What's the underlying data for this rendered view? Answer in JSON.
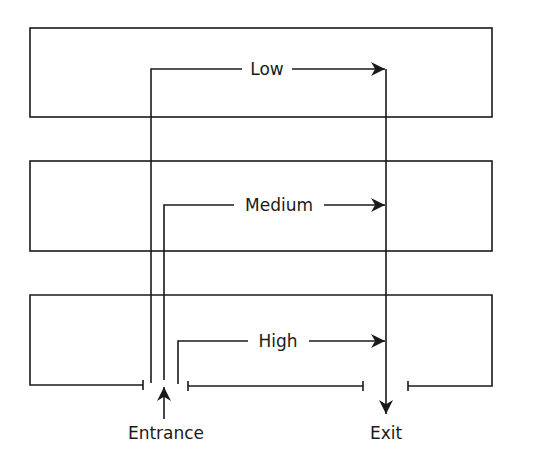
{
  "diagram": {
    "type": "flow-path",
    "colors": {
      "line": "#1a1a1a",
      "background": "#ffffff"
    },
    "zones": [
      {
        "id": "top",
        "path_label": "Low"
      },
      {
        "id": "middle",
        "path_label": "Medium"
      },
      {
        "id": "bottom",
        "path_label": "High"
      }
    ],
    "entrance_label": "Entrance",
    "exit_label": "Exit"
  }
}
